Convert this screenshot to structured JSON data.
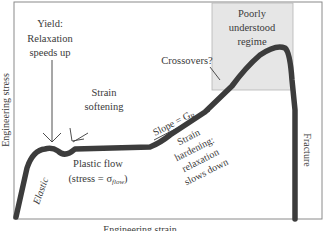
{
  "diagram": {
    "axes": {
      "x_label": "Engineering strain",
      "y_label": "Engineering stress"
    },
    "regions": {
      "poorly_understood": {
        "line1": "Poorly",
        "line2": "understood",
        "line3": "regime",
        "fill": "#e6e6e6"
      }
    },
    "annotations": {
      "yield": {
        "line1": "Yield:",
        "line2": "Relaxation",
        "line3": "speeds up"
      },
      "strain_softening": {
        "line1": "Strain",
        "line2": "softening"
      },
      "crossovers": "Crossovers?",
      "slope": {
        "prefix": "Slope = G",
        "subscript": "R"
      },
      "strain_hardening": {
        "line1": "Strain",
        "line2": "hardening:",
        "line3": "relaxation",
        "line4": "slows down"
      },
      "plastic_flow": {
        "line1": "Plastic flow",
        "line2_prefix": "(stress = σ",
        "line2_sub": "flow",
        "line2_suffix": ")"
      },
      "elastic": "Elastic",
      "fracture": "Fracture"
    },
    "colors": {
      "curve": "#3c3c3c",
      "frame": "#8a8a8a",
      "text": "#3a3a3a"
    }
  }
}
